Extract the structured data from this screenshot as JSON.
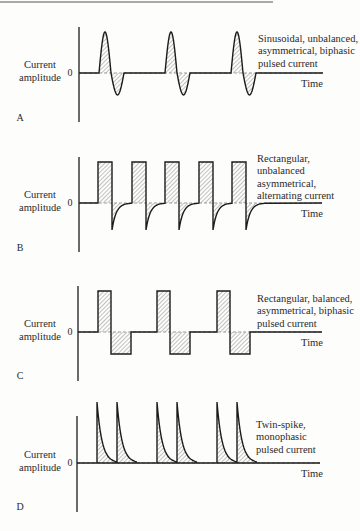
{
  "figure": {
    "colors": {
      "ink": "#1c1c1c",
      "hatch": "#6a6a6a",
      "background": "#fdfdfc"
    },
    "y_axis_label": [
      "Current",
      "amplitude"
    ],
    "zero_tick": "0",
    "x_axis_label": "Time",
    "panels": [
      {
        "id": "A",
        "letter": "A",
        "waveform": "sinusoidal-biphasic",
        "description": [
          "Sinusoidal, unbalanced,",
          "asymmetrical, biphasic",
          "pulsed current"
        ],
        "pulse_starts": [
          99,
          165,
          231
        ]
      },
      {
        "id": "B",
        "letter": "B",
        "waveform": "rectangular-alternating-decay",
        "description": [
          "Rectangular,",
          "unbalanced",
          "asymmetrical,",
          "alternating current"
        ],
        "pulse_starts": [
          98,
          132,
          165,
          199,
          232
        ]
      },
      {
        "id": "C",
        "letter": "C",
        "waveform": "rectangular-biphasic",
        "description": [
          "Rectangular, balanced,",
          "asymmetrical, biphasic",
          "pulsed current"
        ],
        "pulse_starts": [
          98,
          157,
          217
        ]
      },
      {
        "id": "D",
        "letter": "D",
        "waveform": "twin-spike-monophasic",
        "description": [
          "Twin-spike,",
          "monophasic",
          "pulsed current"
        ],
        "pulse_starts": [
          97,
          117,
          157,
          177,
          217,
          237
        ]
      }
    ]
  }
}
